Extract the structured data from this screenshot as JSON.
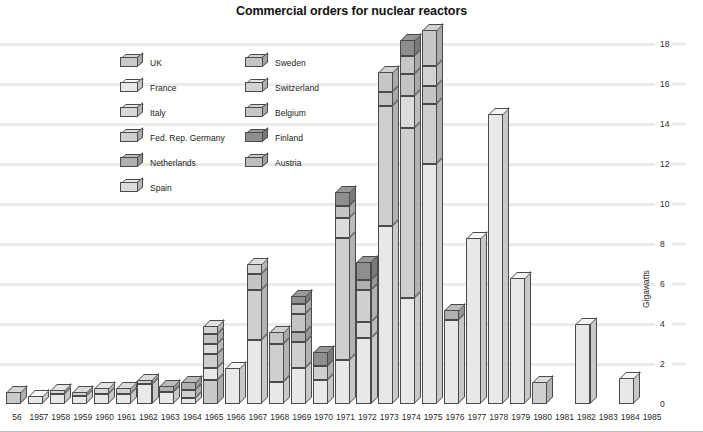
{
  "chart_data": {
    "type": "bar",
    "title": "Commercial orders for nuclear reactors",
    "xlabel": "",
    "ylabel": "Gigawatts",
    "ylim": [
      0,
      19.5
    ],
    "yticks": [
      0,
      2,
      4,
      6,
      8,
      10,
      12,
      14,
      16,
      18
    ],
    "grid": true,
    "stacked": true,
    "legend_position": "inside-top-left",
    "categories": [
      "1956",
      "1957",
      "1958",
      "1959",
      "1960",
      "1961",
      "1962",
      "1963",
      "1964",
      "1965",
      "1966",
      "1967",
      "1968",
      "1969",
      "1970",
      "1971",
      "1972",
      "1973",
      "1974",
      "1975",
      "1976",
      "1977",
      "1978",
      "1979",
      "1980",
      "1981",
      "1982",
      "1983",
      "1984",
      "1985"
    ],
    "series": [
      {
        "name": "UK",
        "color": "#c9c9c9",
        "values": [
          0.6,
          0.0,
          0.0,
          0.0,
          0.0,
          0.0,
          0.0,
          0.0,
          0.0,
          1.2,
          0.0,
          0.0,
          0.0,
          0.0,
          0.0,
          0.0,
          0.0,
          0.0,
          0.0,
          0.0,
          0.0,
          0.0,
          0.0,
          0.0,
          0.0,
          0.0,
          0.0,
          0.0,
          0.0,
          0.0
        ]
      },
      {
        "name": "France",
        "color": "#e8e8e8",
        "values": [
          0.0,
          0.4,
          0.5,
          0.4,
          0.5,
          0.5,
          1.0,
          0.6,
          0.3,
          0.6,
          1.8,
          3.2,
          1.1,
          1.8,
          1.2,
          2.2,
          3.3,
          8.9,
          5.3,
          12.0,
          4.2,
          8.3,
          14.5,
          6.3,
          0.0,
          0.0,
          4.0,
          0.0,
          1.3,
          0.0
        ]
      },
      {
        "name": "Italy",
        "color": "#d8d8d8",
        "values": [
          0.0,
          0.0,
          0.2,
          0.0,
          0.3,
          0.0,
          0.0,
          0.0,
          0.0,
          0.0,
          0.0,
          0.0,
          0.0,
          0.0,
          0.0,
          0.0,
          0.8,
          0.0,
          0.0,
          0.0,
          0.0,
          0.0,
          0.0,
          0.0,
          0.0,
          0.0,
          0.0,
          0.0,
          0.0,
          0.0
        ]
      },
      {
        "name": "Fed. Rep. Germany",
        "color": "#cfcfcf",
        "values": [
          0.0,
          0.0,
          0.0,
          0.2,
          0.0,
          0.3,
          0.2,
          0.0,
          0.4,
          0.7,
          0.0,
          2.5,
          1.9,
          1.3,
          0.7,
          6.1,
          1.6,
          6.0,
          8.5,
          3.0,
          0.0,
          0.0,
          0.0,
          0.0,
          1.1,
          0.0,
          0.0,
          0.0,
          0.0,
          0.0
        ]
      },
      {
        "name": "Netherlands",
        "color": "#b0b0b0",
        "values": [
          0.0,
          0.0,
          0.0,
          0.0,
          0.0,
          0.0,
          0.0,
          0.3,
          0.4,
          0.0,
          0.0,
          0.0,
          0.0,
          0.5,
          0.0,
          0.0,
          0.5,
          0.0,
          0.0,
          0.0,
          0.5,
          0.0,
          0.0,
          0.0,
          0.0,
          0.0,
          0.0,
          0.0,
          0.0,
          0.0
        ]
      },
      {
        "name": "Spain",
        "color": "#dcdcdc",
        "values": [
          0.0,
          0.0,
          0.0,
          0.0,
          0.0,
          0.0,
          0.0,
          0.0,
          0.0,
          0.5,
          0.0,
          0.0,
          0.0,
          0.0,
          0.0,
          1.0,
          0.0,
          0.0,
          1.6,
          0.0,
          0.0,
          0.0,
          0.0,
          0.0,
          0.0,
          0.0,
          0.0,
          0.0,
          0.0,
          0.0
        ]
      },
      {
        "name": "Sweden",
        "color": "#c4c4c4",
        "values": [
          0.0,
          0.0,
          0.0,
          0.0,
          0.0,
          0.0,
          0.0,
          0.0,
          0.0,
          0.5,
          0.0,
          0.8,
          0.0,
          0.9,
          0.0,
          0.6,
          0.0,
          0.7,
          1.1,
          0.9,
          0.0,
          0.0,
          0.0,
          0.0,
          0.0,
          0.0,
          0.0,
          0.0,
          0.0,
          0.0
        ]
      },
      {
        "name": "Switzerland",
        "color": "#d2d2d2",
        "values": [
          0.0,
          0.0,
          0.0,
          0.0,
          0.0,
          0.0,
          0.0,
          0.0,
          0.0,
          0.4,
          0.0,
          0.5,
          0.0,
          0.0,
          0.0,
          0.0,
          0.0,
          0.0,
          0.0,
          1.0,
          0.0,
          0.0,
          0.0,
          0.0,
          0.0,
          0.0,
          0.0,
          0.0,
          0.0,
          0.0
        ]
      },
      {
        "name": "Belgium",
        "color": "#c6c6c6",
        "values": [
          0.0,
          0.0,
          0.0,
          0.0,
          0.0,
          0.0,
          0.0,
          0.0,
          0.0,
          0.0,
          0.0,
          0.0,
          0.6,
          0.5,
          0.0,
          0.0,
          0.0,
          1.0,
          0.9,
          1.8,
          0.0,
          0.0,
          0.0,
          0.0,
          0.0,
          0.0,
          0.0,
          0.0,
          0.0,
          0.0
        ]
      },
      {
        "name": "Finland",
        "color": "#8e8e8e",
        "values": [
          0.0,
          0.0,
          0.0,
          0.0,
          0.0,
          0.0,
          0.0,
          0.0,
          0.0,
          0.0,
          0.0,
          0.0,
          0.0,
          0.4,
          0.7,
          0.7,
          0.9,
          0.0,
          0.8,
          0.0,
          0.0,
          0.0,
          0.0,
          0.0,
          0.0,
          0.0,
          0.0,
          0.0,
          0.0,
          0.0
        ]
      },
      {
        "name": "Austria",
        "color": "#bdbdbd",
        "values": [
          0.0,
          0.0,
          0.0,
          0.0,
          0.0,
          0.0,
          0.0,
          0.0,
          0.0,
          0.0,
          0.0,
          0.0,
          0.0,
          0.0,
          0.0,
          0.0,
          0.0,
          0.0,
          0.0,
          0.0,
          0.0,
          0.0,
          0.0,
          0.0,
          0.0,
          0.0,
          0.0,
          0.0,
          0.0,
          0.0
        ]
      }
    ],
    "totals": [
      0.6,
      0.4,
      0.7,
      0.6,
      0.8,
      0.8,
      1.2,
      0.9,
      1.1,
      3.9,
      1.8,
      7.0,
      3.6,
      5.4,
      2.6,
      10.6,
      7.1,
      16.6,
      18.2,
      18.7,
      4.7,
      8.3,
      14.5,
      6.3,
      1.1,
      0.0,
      4.0,
      0.0,
      1.3,
      0.0
    ]
  },
  "legend": {
    "left_column": [
      {
        "label": "UK"
      },
      {
        "label": "France"
      },
      {
        "label": "Italy"
      },
      {
        "label": "Fed. Rep. Germany"
      },
      {
        "label": "Netherlands"
      },
      {
        "label": "Spain"
      }
    ],
    "right_column": [
      {
        "label": "Sweden"
      },
      {
        "label": "Switzerland"
      },
      {
        "label": "Belgium"
      },
      {
        "label": "Finland"
      },
      {
        "label": "Austria"
      }
    ]
  },
  "colors": {
    "background": "#ffffff",
    "gridline": "#ececec",
    "outline": "#4a4a4a",
    "text": "#1a1a1a"
  }
}
